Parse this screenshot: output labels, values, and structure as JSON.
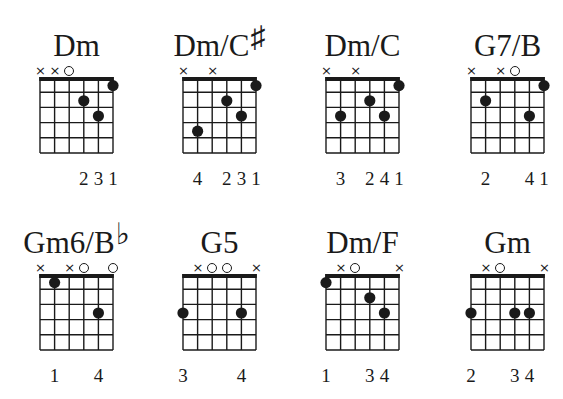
{
  "strings": [
    "E",
    "A",
    "D",
    "G",
    "B",
    "e"
  ],
  "frets_shown": 5,
  "colors": {
    "ink": "#1a1a1a",
    "background": "#ffffff"
  },
  "chords": [
    {
      "name": "Dm",
      "root": "Dm",
      "accidental": "",
      "markers": [
        "x",
        "x",
        "o",
        null,
        null,
        null
      ],
      "dots": [
        {
          "string": 3,
          "fret": 2
        },
        {
          "string": 4,
          "fret": 3
        },
        {
          "string": 5,
          "fret": 1
        }
      ],
      "fingering": [
        "",
        "",
        "",
        "2",
        "3",
        "1"
      ]
    },
    {
      "name": "Dm/C♯",
      "root": "Dm/C",
      "accidental": "♯",
      "markers": [
        "x",
        null,
        "x",
        null,
        null,
        null
      ],
      "dots": [
        {
          "string": 1,
          "fret": 4
        },
        {
          "string": 3,
          "fret": 2
        },
        {
          "string": 4,
          "fret": 3
        },
        {
          "string": 5,
          "fret": 1
        }
      ],
      "fingering": [
        "",
        "4",
        "",
        "2",
        "3",
        "1"
      ]
    },
    {
      "name": "Dm/C",
      "root": "Dm/C",
      "accidental": "",
      "markers": [
        "x",
        null,
        "x",
        null,
        null,
        null
      ],
      "dots": [
        {
          "string": 1,
          "fret": 3
        },
        {
          "string": 3,
          "fret": 2
        },
        {
          "string": 4,
          "fret": 3
        },
        {
          "string": 5,
          "fret": 1
        }
      ],
      "fingering": [
        "",
        "3",
        "",
        "2",
        "4",
        "1"
      ]
    },
    {
      "name": "G7/B",
      "root": "G7/B",
      "accidental": "",
      "markers": [
        "x",
        null,
        "x",
        "o",
        null,
        null
      ],
      "dots": [
        {
          "string": 1,
          "fret": 2
        },
        {
          "string": 4,
          "fret": 3
        },
        {
          "string": 5,
          "fret": 1
        }
      ],
      "fingering": [
        "",
        "2",
        "",
        "",
        "4",
        "1"
      ]
    },
    {
      "name": "Gm6/B♭",
      "root": "Gm6/B",
      "accidental": "♭",
      "markers": [
        "x",
        null,
        "x",
        "o",
        null,
        "o"
      ],
      "dots": [
        {
          "string": 1,
          "fret": 1
        },
        {
          "string": 4,
          "fret": 3
        }
      ],
      "fingering": [
        "",
        "1",
        "",
        "",
        "4",
        ""
      ]
    },
    {
      "name": "G5",
      "root": "G5",
      "accidental": "",
      "markers": [
        null,
        "x",
        "o",
        "o",
        null,
        "x"
      ],
      "dots": [
        {
          "string": 0,
          "fret": 3
        },
        {
          "string": 4,
          "fret": 3
        }
      ],
      "fingering": [
        "3",
        "",
        "",
        "",
        "4",
        ""
      ]
    },
    {
      "name": "Dm/F",
      "root": "Dm/F",
      "accidental": "",
      "markers": [
        null,
        "x",
        "o",
        null,
        null,
        "x"
      ],
      "dots": [
        {
          "string": 0,
          "fret": 1
        },
        {
          "string": 3,
          "fret": 2
        },
        {
          "string": 4,
          "fret": 3
        }
      ],
      "fingering": [
        "1",
        "",
        "",
        "3",
        "4",
        ""
      ]
    },
    {
      "name": "Gm",
      "root": "Gm",
      "accidental": "",
      "markers": [
        null,
        "x",
        "o",
        null,
        null,
        "x"
      ],
      "dots": [
        {
          "string": 0,
          "fret": 3
        },
        {
          "string": 3,
          "fret": 3
        },
        {
          "string": 4,
          "fret": 3
        }
      ],
      "fingering": [
        "2",
        "",
        "",
        "3",
        "4",
        ""
      ]
    }
  ],
  "layout": {
    "grid_left": [
      40,
      183,
      326,
      471
    ],
    "title_top": [
      28,
      225
    ],
    "grid_top": [
      77,
      274
    ],
    "string_spacing": 14.6,
    "fret_spacing": 15.2
  }
}
